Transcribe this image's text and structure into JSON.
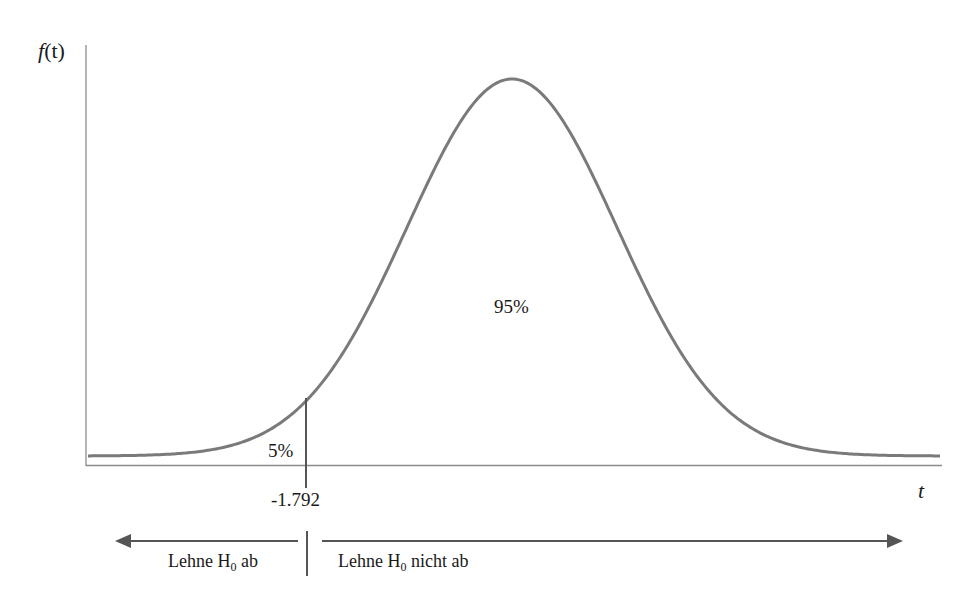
{
  "chart_data": {
    "type": "line",
    "title": "",
    "xlabel": "t",
    "ylabel": "f(t)",
    "critical_value": -1.792,
    "areas": [
      {
        "label": "5%",
        "region": "left of critical value",
        "value": 0.05
      },
      {
        "label": "95%",
        "region": "right of critical value",
        "value": 0.95
      }
    ],
    "decision_regions": [
      {
        "label": "Lehne H0 ab",
        "direction": "left"
      },
      {
        "label": "Lehne H0 nicht ab",
        "direction": "right"
      }
    ],
    "grid": false,
    "legend": null
  },
  "labels": {
    "y_axis_f": "f",
    "y_axis_rest": "(t)",
    "x_axis": "t",
    "tail_area": "5%",
    "body_area": "95%",
    "critical_value": "-1.792",
    "reject_prefix": "Lehne H",
    "reject_sub": "0",
    "reject_suffix": " ab",
    "accept_prefix": "Lehne H",
    "accept_sub": "0",
    "accept_suffix": " nicht ab"
  },
  "colors": {
    "curve": "#7a7a7a",
    "axis": "#8c8c8c",
    "line": "#555555",
    "text": "#1a1a1a"
  }
}
